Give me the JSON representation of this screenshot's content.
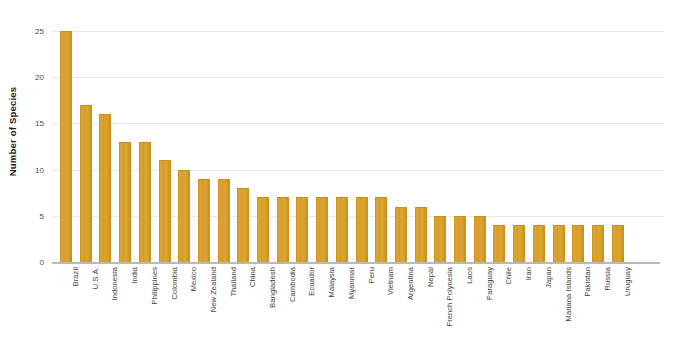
{
  "chart_data": {
    "type": "bar",
    "title": "",
    "xlabel": "",
    "ylabel": "Number of Species",
    "ylim": [
      0,
      25
    ],
    "yticks": [
      0,
      5,
      10,
      15,
      20,
      25
    ],
    "grid": true,
    "legend": false,
    "bar_color": "#D9A02B",
    "gridline_color": "#E9E9E9",
    "axis_color": "#B9B9B9",
    "background_color": "#FFFFFF",
    "categories": [
      "Brazil",
      "U.S.A.",
      "Indonesia",
      "India",
      "Philippines",
      "Colombia",
      "Mexico",
      "New Zealand",
      "Thailand",
      "China",
      "Bangladesh",
      "Cambodia",
      "Ecuador",
      "Malaysia",
      "Myanmar",
      "Peru",
      "Vietnam",
      "Argentina",
      "Nepal",
      "French Polynesia",
      "Laos",
      "Paraguay",
      "Chile",
      "Iran",
      "Japan",
      "Mariana Islands",
      "Pakistan",
      "Russia",
      "Uruguay"
    ],
    "values": [
      25,
      17,
      16,
      13,
      13,
      11,
      10,
      9,
      9,
      8,
      7,
      7,
      7,
      7,
      7,
      7,
      7,
      6,
      6,
      5,
      5,
      5,
      4,
      4,
      4,
      4,
      4,
      4,
      4
    ]
  }
}
